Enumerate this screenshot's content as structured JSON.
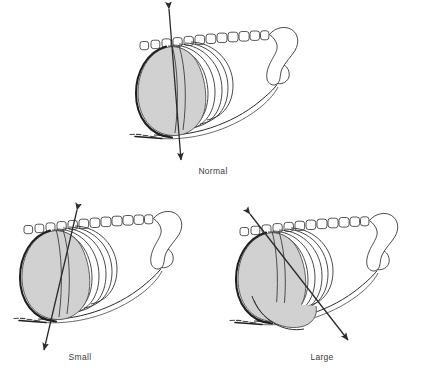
{
  "figure": {
    "type": "anatomical-line-drawing",
    "background_color": "#ffffff",
    "ink_color": "#2b2b2b",
    "shaded_fill_color": "#cfcfcf",
    "shaded_stroke_color": "#6f6f6f",
    "caption_color": "#3a3a3a"
  },
  "panels": [
    {
      "id": "normal",
      "caption": "Normal",
      "caption_x": 213,
      "caption_y": 174,
      "vertebrae_count": 12,
      "rib_arc_count": 5,
      "axis_arrow": {
        "name": "double-headed-axis-arrow",
        "angle_deg": 5,
        "description": "near-vertical double-headed arrow through the thoracic mass",
        "x1": 169,
        "y1": 9,
        "x2": 181,
        "y2": 160
      }
    },
    {
      "id": "small",
      "caption": "Small",
      "caption_x": 80,
      "caption_y": 360,
      "vertebrae_count": 12,
      "rib_arc_count": 5,
      "axis_arrow": {
        "name": "double-headed-axis-arrow",
        "angle_deg": 20,
        "description": "double-headed arrow tilted, upper end leaning right",
        "x1": 77,
        "y1": 210,
        "x2": 44,
        "y2": 350
      }
    },
    {
      "id": "large",
      "caption": "Large",
      "caption_x": 322,
      "caption_y": 360,
      "vertebrae_count": 12,
      "rib_arc_count": 5,
      "axis_arrow": {
        "name": "double-headed-axis-arrow",
        "angle_deg": -40,
        "description": "double-headed arrow tilted strongly, upper end leaning left",
        "x1": 250,
        "y1": 214,
        "x2": 348,
        "y2": 340
      }
    }
  ]
}
